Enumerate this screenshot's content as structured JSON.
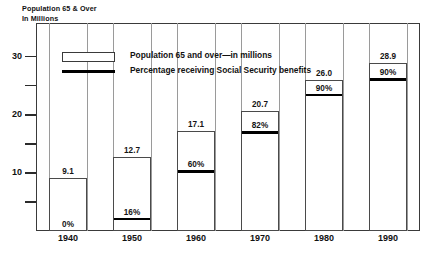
{
  "title": "Population 65 & Over\nIn Millions",
  "legend": {
    "items": [
      {
        "icon": "white-box-swatch",
        "label": "Population 65 and over—in millions"
      },
      {
        "icon": "black-line-swatch",
        "label": "Percentage receiving Social Security benefits"
      }
    ]
  },
  "axes": {
    "y_major_ticks": [
      "10",
      "20",
      "30"
    ],
    "y_minor_ticks": [
      "5",
      "15",
      "25"
    ],
    "x_ticks": [
      "1940",
      "1950",
      "1960",
      "1970",
      "1980",
      "1990"
    ]
  },
  "colors": {
    "bar_fill": "#ffffff",
    "bar_stroke": "#4a4a4a",
    "percent_line": "#000000",
    "frame": "#3a3a3a",
    "text": "#111111",
    "background": "#ffffff"
  },
  "chart_data": {
    "type": "bar",
    "title": "Population 65 & Over In Millions",
    "xlabel": "",
    "ylabel": "Population 65 & Over In Millions",
    "ylim": [
      0,
      33
    ],
    "grid": false,
    "legend_position": "inside-top-left",
    "categories": [
      "1940",
      "1950",
      "1960",
      "1970",
      "1980",
      "1990"
    ],
    "series": [
      {
        "name": "Population 65 and over—in millions",
        "type": "bar",
        "values": [
          9.1,
          12.7,
          17.1,
          20.7,
          26.0,
          28.9
        ],
        "labels": [
          "9.1",
          "12.7",
          "17.1",
          "20.7",
          "26.0",
          "28.9"
        ]
      },
      {
        "name": "Percentage receiving Social Security benefits",
        "type": "line-marker-in-bar",
        "values": [
          0,
          16,
          60,
          82,
          90,
          90
        ],
        "labels": [
          "0%",
          "16%",
          "60%",
          "82%",
          "90%",
          "90%"
        ]
      }
    ]
  }
}
